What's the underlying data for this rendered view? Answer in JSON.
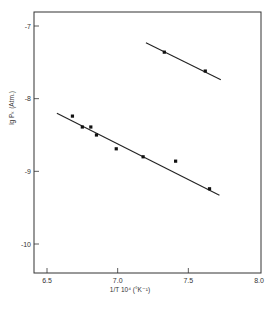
{
  "chart_data": {
    "type": "scatter",
    "title": "",
    "xlabel": "1/T  10⁴  (°K⁻¹)",
    "ylabel": "lg  Pₖ  (Atm.)",
    "xlim": [
      6.4,
      8.0
    ],
    "ylim": [
      -10.4,
      -6.8
    ],
    "xticks": [
      6.5,
      7.0,
      7.5,
      8.0
    ],
    "xtick_labels": [
      "6.5",
      "7.0",
      "7.5",
      "8.0"
    ],
    "yticks": [
      -7,
      -8,
      -9,
      -10
    ],
    "ytick_labels": [
      "-7",
      "-8",
      "-9",
      "-10"
    ],
    "grid": false,
    "legend": null,
    "series": [
      {
        "name": "lower series",
        "points": [
          {
            "x": 6.68,
            "y": -8.24
          },
          {
            "x": 6.75,
            "y": -8.39
          },
          {
            "x": 6.81,
            "y": -8.39
          },
          {
            "x": 6.85,
            "y": -8.5
          },
          {
            "x": 6.99,
            "y": -8.69
          },
          {
            "x": 7.18,
            "y": -8.8
          },
          {
            "x": 7.41,
            "y": -8.86
          },
          {
            "x": 7.65,
            "y": -9.24
          }
        ],
        "fit_line": {
          "x1": 6.57,
          "y1": -8.2,
          "x2": 7.72,
          "y2": -9.33
        }
      },
      {
        "name": "upper series",
        "points": [
          {
            "x": 7.33,
            "y": -7.36
          },
          {
            "x": 7.62,
            "y": -7.62
          }
        ],
        "fit_line": {
          "x1": 7.2,
          "y1": -7.23,
          "x2": 7.73,
          "y2": -7.74
        }
      }
    ]
  }
}
